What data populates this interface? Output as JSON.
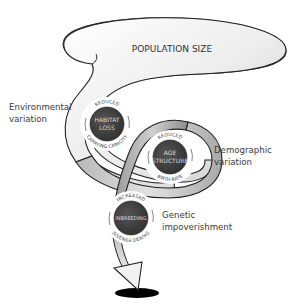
{
  "title": "POPULATION SIZE",
  "labels": {
    "environmental": [
      "Environmental",
      "variation"
    ],
    "demographic": [
      "Demographic",
      "variation"
    ],
    "genetic": [
      "Genetic",
      "impoverishment"
    ]
  },
  "circles": [
    {
      "id": "habitat-loss",
      "title_lines": [
        "HABITAT",
        "LOSS"
      ],
      "top_arc": "REDUCED",
      "bottom_arc": "CARRYING CAPACITY"
    },
    {
      "id": "age-structure",
      "title_lines": [
        "AGE",
        "STRUCTURE"
      ],
      "top_arc": "REDUCED",
      "bottom_arc": "BIRTH RATE"
    },
    {
      "id": "inbreeding",
      "title_lines": [
        "INBREEDING"
      ],
      "top_arc": "INCREASED",
      "bottom_arc": "JUVENILE DEATHS"
    }
  ],
  "colors": {
    "circle_fill": "#3d3d3d",
    "vortex_stroke": "#222222",
    "vortex_fill_light": "#f4f4f4",
    "vortex_fill_dark": "#9a9a9a",
    "hole": "#000000"
  }
}
